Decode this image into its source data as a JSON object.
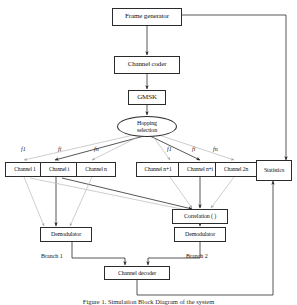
{
  "figure": {
    "caption": "Figure 1. Simulation Block Diagram of the system",
    "background": "#ffffff",
    "line_color": "#2b2b2b",
    "faint_line_color": "#b9b9b9"
  },
  "nodes": {
    "frame_generator": "Frame generator",
    "channel_coder": "Channel coder",
    "gmsk": "GMSK",
    "hopping_selection_line1": "Hopping",
    "hopping_selection_line2": "selection",
    "channel_1": "Channel 1",
    "channel_i": "Channel i",
    "channel_n": "Channel n",
    "channel_n_plus_1": "Channel n+1",
    "channel_n_plus_i": "Channel n+i",
    "channel_2n": "Channel 2n",
    "statistics": "Statistics",
    "correlation": "Correlation ( )",
    "demodulator_left": "Demodulator",
    "demodulator_right": "Demodulator",
    "channel_decoder": "Channel decoder"
  },
  "labels": {
    "freq_left_1": "f1",
    "freq_left_i": "fi",
    "freq_left_n": "fn",
    "freq_right_1": "f1",
    "freq_right_i": "fi",
    "freq_right_n": "fn",
    "branch_1": "Branch 1",
    "branch_2": "Branch 2"
  }
}
